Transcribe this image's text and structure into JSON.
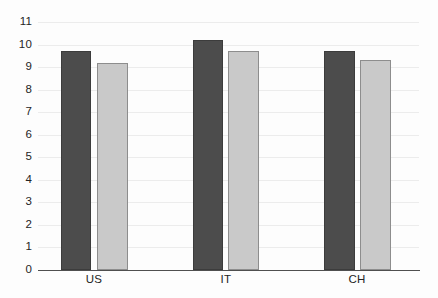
{
  "chart_data": {
    "type": "bar",
    "title": "",
    "subtitle": "",
    "xlabel": "",
    "ylabel": "",
    "categories": [
      "US",
      "IT",
      "CH"
    ],
    "series": [
      {
        "name": "series-1",
        "color": "#4c4c4c",
        "values": [
          9.7,
          10.2,
          9.7
        ]
      },
      {
        "name": "series-2",
        "color": "#c9c9c9",
        "values": [
          9.2,
          9.7,
          9.3
        ]
      }
    ],
    "ylim": [
      0,
      11
    ],
    "yticks": [
      0,
      1,
      2,
      3,
      4,
      5,
      6,
      7,
      8,
      9,
      10,
      11
    ],
    "ytick_labels": [
      "0",
      "1",
      "2",
      "3",
      "4",
      "5",
      "6",
      "7",
      "8",
      "9",
      "10",
      "11"
    ],
    "grid": true,
    "grid_axis": "y",
    "legend": false,
    "legend_position": "none",
    "background_color": "#fdfdfd",
    "grid_color": "#ececec",
    "axis_color": "#4f4f4f",
    "bar_border_dark": "#3c3c3c",
    "bar_border_light": "#8d8d8d"
  }
}
